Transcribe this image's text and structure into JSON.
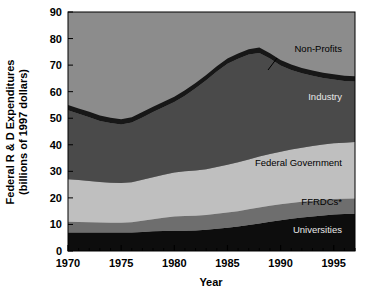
{
  "chart_data": {
    "type": "area",
    "stacked": true,
    "title": "",
    "xlabel": "Year",
    "ylabel": "Federal R & D Expenditures\n(billions of 1997 dollars)",
    "ylabel_line1": "Federal R & D Expenditures",
    "ylabel_line2": "(billions of 1997 dollars)",
    "x": [
      1970,
      1971,
      1972,
      1973,
      1974,
      1975,
      1976,
      1977,
      1978,
      1979,
      1980,
      1981,
      1982,
      1983,
      1984,
      1985,
      1986,
      1987,
      1988,
      1989,
      1990,
      1991,
      1992,
      1993,
      1994,
      1995,
      1996,
      1997
    ],
    "xlim": [
      1970,
      1997
    ],
    "ylim": [
      0,
      90
    ],
    "yticks": [
      0,
      10,
      20,
      30,
      40,
      50,
      60,
      70,
      80,
      90
    ],
    "xticks": [
      1970,
      1975,
      1980,
      1985,
      1990,
      1995
    ],
    "xtick_labels": [
      "1970",
      "1975",
      "1980",
      "1985",
      "1990",
      "1995"
    ],
    "ytick_labels": [
      "0",
      "10",
      "20",
      "30",
      "40",
      "50",
      "60",
      "70",
      "80",
      "90"
    ],
    "minor_xticks": [
      1971,
      1972,
      1973,
      1974,
      1976,
      1977,
      1978,
      1979,
      1981,
      1982,
      1983,
      1984,
      1986,
      1987,
      1988,
      1989,
      1991,
      1992,
      1993,
      1994,
      1996,
      1997
    ],
    "grid": false,
    "legend_position": "inline-annotations",
    "series": [
      {
        "name": "Universities",
        "color": "#0d0d0d",
        "label_color": "light",
        "values": [
          7.0,
          7.0,
          7.0,
          7.0,
          7.0,
          7.0,
          7.0,
          7.2,
          7.4,
          7.5,
          7.6,
          7.6,
          7.7,
          8.0,
          8.4,
          8.8,
          9.2,
          9.8,
          10.4,
          11.0,
          11.6,
          12.1,
          12.6,
          13.0,
          13.4,
          13.7,
          13.9,
          14.0
        ]
      },
      {
        "name": "FFRDCs*",
        "color": "#6e6e6e",
        "label_color": "dark",
        "values": [
          4.0,
          3.9,
          3.8,
          3.7,
          3.6,
          3.6,
          3.8,
          4.2,
          4.6,
          5.0,
          5.4,
          5.6,
          5.6,
          5.6,
          5.6,
          5.7,
          5.8,
          5.9,
          6.0,
          6.0,
          6.0,
          6.0,
          5.9,
          5.9,
          5.9,
          5.9,
          5.8,
          5.8
        ]
      },
      {
        "name": "Federal Government",
        "color": "#bfbfbf",
        "label_color": "dark",
        "values": [
          16.0,
          15.8,
          15.6,
          15.3,
          15.1,
          15.0,
          15.1,
          15.4,
          15.8,
          16.2,
          16.6,
          16.8,
          17.0,
          17.2,
          17.6,
          18.0,
          18.4,
          18.8,
          19.2,
          19.5,
          19.8,
          20.1,
          20.4,
          20.6,
          20.8,
          21.0,
          21.1,
          21.2
        ]
      },
      {
        "name": "Industry",
        "color": "#4a4a4a",
        "label_color": "light",
        "values": [
          26.0,
          25.0,
          24.0,
          23.0,
          22.5,
          22.0,
          22.5,
          23.5,
          24.5,
          25.5,
          26.5,
          28.5,
          31.0,
          33.5,
          36.0,
          38.0,
          39.0,
          39.5,
          39.0,
          36.0,
          32.5,
          30.0,
          28.0,
          26.5,
          25.0,
          24.0,
          23.2,
          22.8
        ]
      },
      {
        "name": "Non-Profits",
        "color": "#171717",
        "label_color": "dark",
        "values": [
          2.0,
          2.0,
          2.0,
          2.0,
          2.0,
          2.0,
          2.0,
          2.0,
          2.0,
          2.0,
          2.0,
          2.0,
          2.0,
          2.0,
          2.0,
          2.0,
          2.0,
          2.0,
          2.0,
          2.0,
          2.0,
          2.0,
          2.0,
          2.0,
          2.0,
          2.0,
          2.0,
          2.0
        ]
      }
    ],
    "totals_note": "Stacked totals peak near 78 in 1988",
    "plot_background": "#8c8c8c",
    "annotations": [
      {
        "text": "Non-Profits",
        "target_series": "Non-Profits",
        "has_leader_line": true
      },
      {
        "text": "Industry",
        "target_series": "Industry",
        "has_leader_line": false
      },
      {
        "text": "Federal Government",
        "target_series": "Federal Government",
        "has_leader_line": false
      },
      {
        "text": "FFRDCs*",
        "target_series": "FFRDCs*",
        "has_leader_line": false
      },
      {
        "text": "Universities",
        "target_series": "Universities",
        "has_leader_line": false
      }
    ]
  },
  "colors": {
    "universities": "#0d0d0d",
    "ffrdcs": "#6e6e6e",
    "federal_government": "#bfbfbf",
    "industry": "#4a4a4a",
    "non_profits": "#171717",
    "plot_area": "#8c8c8c",
    "axis": "#000000",
    "page_background": "#ffffff"
  }
}
